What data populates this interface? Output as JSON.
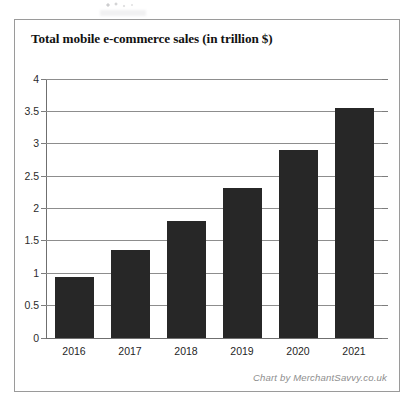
{
  "card": {
    "title": "Total mobile e-commerce sales (in trillion $)",
    "credit": "Chart by MerchantSavvy.co.uk"
  },
  "colors": {
    "bar": "#272727",
    "gridline": "#8d8d8d",
    "border": "#9a9a9a",
    "credit_text": "#8e8e8e",
    "background": "#ffffff"
  },
  "chart_data": {
    "type": "bar",
    "title": "Total mobile e-commerce sales (in trillion $)",
    "xlabel": "",
    "ylabel": "",
    "categories": [
      "2016",
      "2017",
      "2018",
      "2019",
      "2020",
      "2021"
    ],
    "values": [
      0.95,
      1.36,
      1.8,
      2.32,
      2.91,
      3.56
    ],
    "ylim": [
      0,
      4
    ],
    "ytick_labels": [
      "0",
      "0.5",
      "1",
      "1.5",
      "2",
      "2.5",
      "3",
      "3.5",
      "4"
    ],
    "ytick_values": [
      0,
      0.5,
      1,
      1.5,
      2,
      2.5,
      3,
      3.5,
      4
    ],
    "grid": true,
    "legend": false,
    "units": "trillion USD",
    "series": [
      {
        "name": "Total mobile e-commerce sales",
        "values": [
          0.95,
          1.36,
          1.8,
          2.32,
          2.91,
          3.56
        ]
      }
    ]
  }
}
